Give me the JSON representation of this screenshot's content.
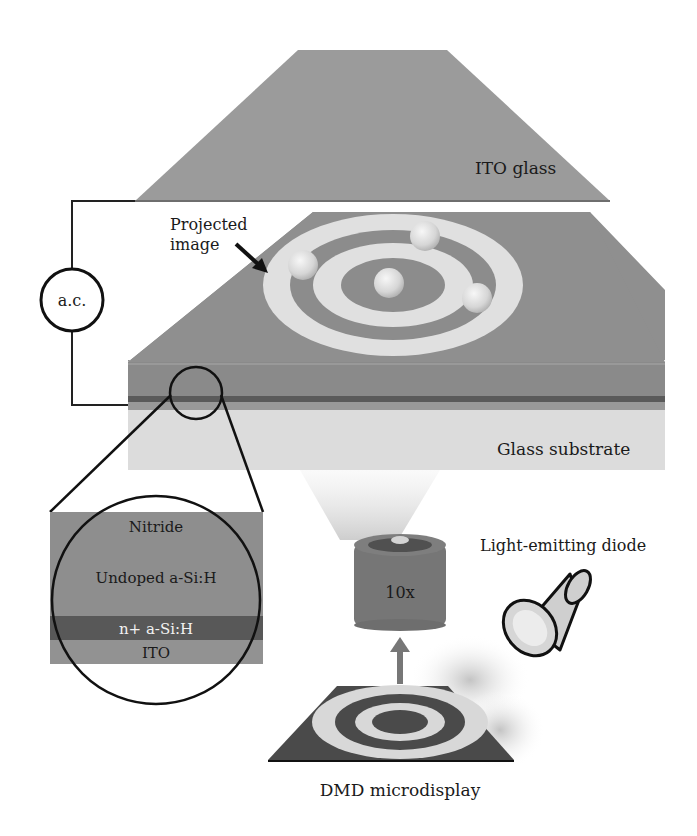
{
  "labels": {
    "ito_glass": "ITO glass",
    "projected_image_line1": "Projected",
    "projected_image_line2": "image",
    "ac_source": "a.c.",
    "glass_substrate": "Glass substrate",
    "inset_nitride": "Nitride",
    "inset_undoped": "Undoped a-Si:H",
    "inset_nplus": "n+ a-Si:H",
    "inset_ito": "ITO",
    "objective_magnification": "10x",
    "led": "Light-emitting diode",
    "dmd": "DMD microdisplay"
  },
  "colors": {
    "ito_glass": "#9b9b9b",
    "device_top": "#8f8f8f",
    "device_layers": "#8a8a8a",
    "dark_layer": "#5a5a5a",
    "substrate": "#dcdcdc",
    "ring_light": "#e0e0e0",
    "ring_dark": "#8c8c8c",
    "lens_body": "#767676",
    "dmd_dark": "#4a4a4a",
    "dmd_light": "#d8d8d8",
    "wire": "#222222"
  }
}
